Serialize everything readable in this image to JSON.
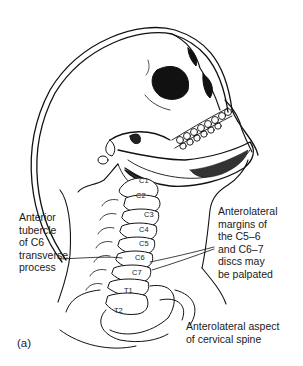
{
  "figure": {
    "panel_label": "(a)",
    "top_text_cut": "...",
    "labels": {
      "anterior_tubercle": "Anterior\ntubercle\nof C6\ntransverse\nprocess",
      "anterolateral_margins": "Anterolateral\nmargins of\nthe C5–6\nand C6–7\ndiscs may\nbe palpated",
      "anterolateral_aspect": "Anterolateral aspect\nof cervical spine"
    },
    "vertebrae": [
      "C1",
      "C2",
      "C3",
      "C4",
      "C5",
      "C6",
      "C7",
      "T1",
      "T2"
    ]
  }
}
